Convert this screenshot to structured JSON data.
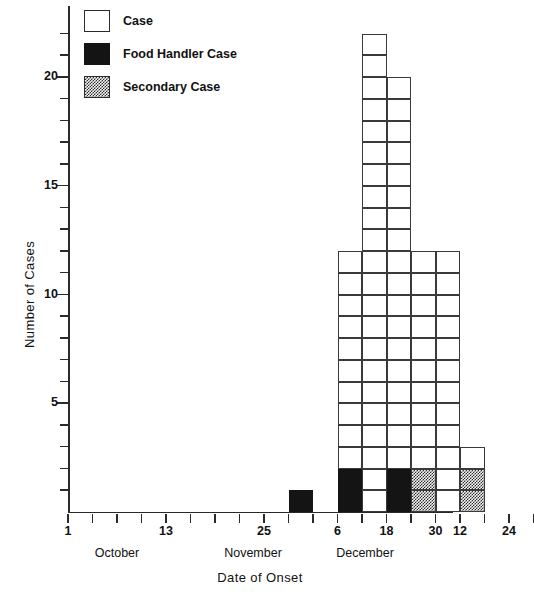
{
  "chart_data": {
    "type": "bar",
    "title": "",
    "xlabel": "Date of Onset",
    "ylabel": "Number of Cases",
    "ylim": [
      0,
      23
    ],
    "y_ticks_labeled": [
      5,
      10,
      15,
      20
    ],
    "y_tick_interval": 1,
    "grid": false,
    "legend_position": "top-left",
    "stacked": true,
    "x_tick_labels": [
      "1",
      "13",
      "25",
      "6",
      "18",
      "30",
      "12",
      "24"
    ],
    "x_group_labels": [
      "October",
      "November",
      "December"
    ],
    "series": [
      {
        "name": "Case",
        "key": "case",
        "color": "#ffffff",
        "pattern": "open"
      },
      {
        "name": "Food Handler Case",
        "key": "food",
        "color": "#141414",
        "pattern": "solid-black"
      },
      {
        "name": "Secondary Case",
        "key": "secondary",
        "color": "#2e2e2e",
        "pattern": "checkered"
      }
    ],
    "bins": [
      {
        "index": 0,
        "x_start": "Oct 1",
        "case": 0,
        "food": 0,
        "secondary": 0,
        "total": 0
      },
      {
        "index": 1,
        "x_start": "Oct 4",
        "case": 0,
        "food": 0,
        "secondary": 0,
        "total": 0
      },
      {
        "index": 2,
        "x_start": "Oct 7",
        "case": 0,
        "food": 0,
        "secondary": 0,
        "total": 0
      },
      {
        "index": 3,
        "x_start": "Oct 10",
        "case": 0,
        "food": 0,
        "secondary": 0,
        "total": 0
      },
      {
        "index": 4,
        "x_start": "Oct 13",
        "case": 0,
        "food": 0,
        "secondary": 0,
        "total": 0
      },
      {
        "index": 5,
        "x_start": "Oct 16",
        "case": 0,
        "food": 0,
        "secondary": 0,
        "total": 0
      },
      {
        "index": 6,
        "x_start": "Oct 19",
        "case": 0,
        "food": 0,
        "secondary": 0,
        "total": 0
      },
      {
        "index": 7,
        "x_start": "Oct 22",
        "case": 0,
        "food": 0,
        "secondary": 0,
        "total": 0
      },
      {
        "index": 8,
        "x_start": "Oct 25",
        "case": 0,
        "food": 0,
        "secondary": 0,
        "total": 0
      },
      {
        "index": 9,
        "x_start": "Oct 28",
        "case": 0,
        "food": 1,
        "secondary": 0,
        "total": 1
      },
      {
        "index": 10,
        "x_start": "Nov 3",
        "case": 0,
        "food": 0,
        "secondary": 0,
        "total": 0
      },
      {
        "index": 11,
        "x_start": "Nov 6",
        "case": 10,
        "food": 2,
        "secondary": 0,
        "total": 12
      },
      {
        "index": 12,
        "x_start": "Nov 12",
        "case": 22,
        "food": 0,
        "secondary": 0,
        "total": 22
      },
      {
        "index": 13,
        "x_start": "Nov 18",
        "case": 18,
        "food": 2,
        "secondary": 0,
        "total": 20
      },
      {
        "index": 14,
        "x_start": "Nov 24",
        "case": 10,
        "food": 0,
        "secondary": 2,
        "total": 12
      },
      {
        "index": 15,
        "x_start": "Nov 30",
        "case": 12,
        "food": 0,
        "secondary": 0,
        "total": 12
      },
      {
        "index": 16,
        "x_start": "Dec 12",
        "case": 1,
        "food": 0,
        "secondary": 2,
        "total": 3
      },
      {
        "index": 17,
        "x_start": "Dec 18",
        "case": 0,
        "food": 0,
        "secondary": 0,
        "total": 0
      },
      {
        "index": 18,
        "x_start": "Dec 24",
        "case": 0,
        "food": 0,
        "secondary": 0,
        "total": 0
      }
    ]
  },
  "legend": {
    "items": [
      {
        "label": "Case",
        "swatch": "case"
      },
      {
        "label": "Food Handler Case",
        "swatch": "food"
      },
      {
        "label": "Secondary Case",
        "swatch": "secondary"
      }
    ]
  },
  "axes": {
    "y_title": "Number of Cases",
    "x_title": "Date of Onset",
    "y_labels": [
      "20",
      "15",
      "10",
      "5"
    ],
    "x_labels": [
      "1",
      "13",
      "25",
      "6",
      "18",
      "30",
      "12",
      "24"
    ],
    "months": [
      "October",
      "November",
      "December"
    ]
  }
}
